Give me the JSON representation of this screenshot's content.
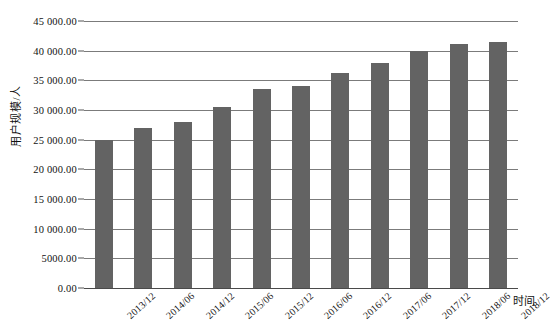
{
  "chart_data": {
    "type": "bar",
    "title": "",
    "xlabel": "时间",
    "ylabel": "用户规模/人",
    "categories": [
      "2013/12",
      "2014/06",
      "2014/12",
      "2015/06",
      "2015/12",
      "2016/06",
      "2016/12",
      "2017/06",
      "2017/12",
      "2018/06",
      "2018/12"
    ],
    "values": [
      24900,
      26900,
      28000,
      30500,
      33500,
      34000,
      36200,
      38000,
      40000,
      41200,
      41400
    ],
    "ylim": [
      0,
      45000
    ],
    "ytick_values": [
      0,
      5000,
      10000,
      15000,
      20000,
      25000,
      30000,
      35000,
      40000,
      45000
    ],
    "ytick_labels": [
      "0.00",
      "5000.00",
      "10 000.00",
      "15 000.00",
      "20 000.00",
      "25 000.00",
      "30 000.00",
      "35 000.00",
      "40 000.00",
      "45 000.00"
    ],
    "grid": true,
    "legend": "none",
    "bar_color": "#636363",
    "gridline_color": "#7b7b7b",
    "background_color": "#ffffff"
  }
}
